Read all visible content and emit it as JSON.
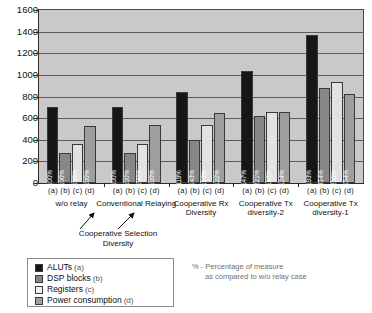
{
  "chart_data": {
    "type": "bar",
    "title": "",
    "xlabel": "",
    "ylabel": "",
    "ylim": [
      0,
      1600
    ],
    "yticks": [
      0,
      200,
      400,
      600,
      800,
      1000,
      1200,
      1400,
      1600
    ],
    "grid": true,
    "legend_position": "bottom-left",
    "categories": [
      "w/o relay",
      "Conventional Relaying",
      "Cooperative Rx Diversity",
      "Cooperative Tx diversity-2",
      "Cooperative Tx diversity-1"
    ],
    "sub_labels": [
      "(a)",
      "(b)",
      "(c)",
      "(d)"
    ],
    "series": [
      {
        "name": "ALUTs (a)",
        "key": "a",
        "color": "#161616",
        "values": [
          700,
          705,
          840,
          1040,
          1370
        ],
        "labels": [
          "100%",
          "100%",
          "119%",
          "147%",
          "193%"
        ]
      },
      {
        "name": "DSP blocks (b)",
        "key": "b",
        "color": "#878787",
        "values": [
          280,
          280,
          400,
          620,
          880
        ],
        "labels": [
          "100%",
          "100%",
          "143%",
          "221%",
          "314%"
        ]
      },
      {
        "name": "Registers (c)",
        "key": "c",
        "color": "#e2e2e2",
        "values": [
          365,
          365,
          540,
          660,
          930
        ],
        "labels": [
          "100%",
          "100%",
          "153%",
          "183%",
          "255%"
        ]
      },
      {
        "name": "Power consumption (d)",
        "key": "d",
        "color": "#9e9e9e",
        "values": [
          530,
          535,
          650,
          660,
          820
        ],
        "labels": [
          "100%",
          "100%",
          "122%",
          "124%",
          "154%"
        ]
      }
    ],
    "annotation": {
      "text_line1": "Cooperative Selection",
      "text_line2": "Diversity",
      "points_to": [
        "w/o relay",
        "Conventional Relaying"
      ]
    },
    "footnote": {
      "line1": "% - Percentage of measure",
      "line2": "as compared to w/o relay case"
    }
  },
  "legend": {
    "items": [
      {
        "label": "ALUTs",
        "key": "(a)"
      },
      {
        "label": "DSP blocks",
        "key": "(b)"
      },
      {
        "label": "Registers",
        "key": "(c)"
      },
      {
        "label": "Power consumption",
        "key": "(d)"
      }
    ]
  }
}
